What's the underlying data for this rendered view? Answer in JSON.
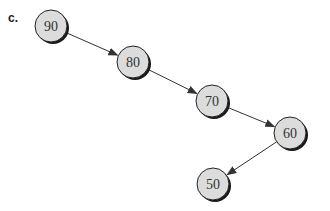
{
  "figure": {
    "label": "c.",
    "nodes": [
      {
        "id": "n90",
        "value": "90",
        "cx": 51,
        "cy": 26
      },
      {
        "id": "n80",
        "value": "80",
        "cx": 133,
        "cy": 62
      },
      {
        "id": "n70",
        "value": "70",
        "cx": 212,
        "cy": 101
      },
      {
        "id": "n60",
        "value": "60",
        "cx": 290,
        "cy": 133
      },
      {
        "id": "n50",
        "value": "50",
        "cx": 213,
        "cy": 184
      }
    ],
    "edges": [
      {
        "from": "n90",
        "to": "n80"
      },
      {
        "from": "n80",
        "to": "n70"
      },
      {
        "from": "n70",
        "to": "n60"
      },
      {
        "from": "n60",
        "to": "n50"
      }
    ],
    "colors": {
      "node_fill": "#dcdcdc",
      "node_stroke": "#222222",
      "shadow": "#1a1a1a",
      "edge": "#333333"
    }
  }
}
